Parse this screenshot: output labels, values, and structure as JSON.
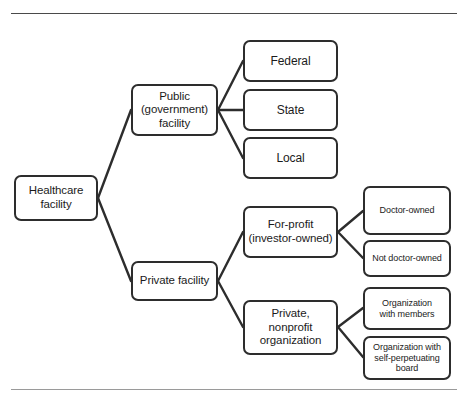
{
  "diagram": {
    "type": "tree",
    "title_visible": false,
    "colors": {
      "box_border": "#2d2d2d",
      "box_fill": "#ffffff",
      "text": "#1b1b1b",
      "connector": "#2d2d2d",
      "rule_top": "#4a4a4a",
      "rule_bottom": "#9a9a9a"
    },
    "rules": {
      "top_label": "top-divider",
      "bottom_label": "bottom-divider"
    },
    "nodes": {
      "root": {
        "label": "Healthcare\nfacility",
        "line1": "Healthcare",
        "line2": "facility"
      },
      "public": {
        "line1": "Public",
        "line2": "(government)",
        "line3": "facility"
      },
      "private": {
        "line1": "Private facility"
      },
      "federal": {
        "line1": "Federal"
      },
      "state": {
        "line1": "State"
      },
      "local": {
        "line1": "Local"
      },
      "for_profit": {
        "line1": "For-profit",
        "line2": "(investor-owned)"
      },
      "nonprofit": {
        "line1": "Private,",
        "line2": "nonprofit",
        "line3": "organization"
      },
      "doctor_owned": {
        "line1": "Doctor-owned"
      },
      "not_doctor_owned": {
        "line1": "Not doctor-owned"
      },
      "org_with_members": {
        "line1": "Organization",
        "line2": "with members"
      },
      "org_self_perpetuating": {
        "line1": "Organization with",
        "line2": "self-perpetuating",
        "line3": "board"
      }
    },
    "edges": [
      {
        "from": "root",
        "to": "public"
      },
      {
        "from": "root",
        "to": "private"
      },
      {
        "from": "public",
        "to": "federal"
      },
      {
        "from": "public",
        "to": "state"
      },
      {
        "from": "public",
        "to": "local"
      },
      {
        "from": "private",
        "to": "for_profit"
      },
      {
        "from": "private",
        "to": "nonprofit"
      },
      {
        "from": "for_profit",
        "to": "doctor_owned"
      },
      {
        "from": "for_profit",
        "to": "not_doctor_owned"
      },
      {
        "from": "nonprofit",
        "to": "org_with_members"
      },
      {
        "from": "nonprofit",
        "to": "org_self_perpetuating"
      }
    ]
  }
}
